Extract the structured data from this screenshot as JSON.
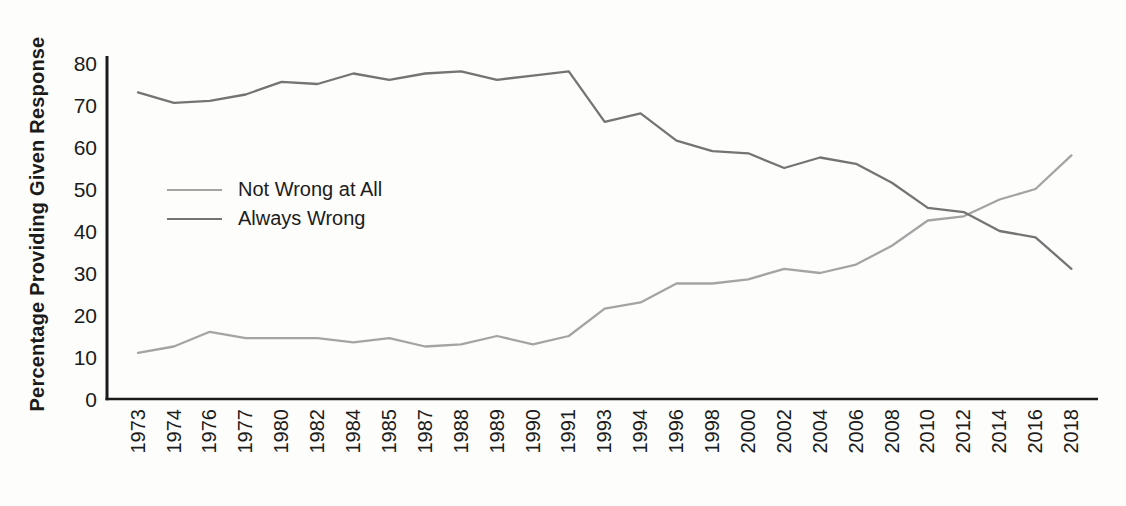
{
  "chart_data": {
    "type": "line",
    "title": "",
    "xlabel": "",
    "ylabel": "Percentage Providing Given Response",
    "categories": [
      "1973",
      "1974",
      "1976",
      "1977",
      "1980",
      "1982",
      "1984",
      "1985",
      "1987",
      "1988",
      "1989",
      "1990",
      "1991",
      "1993",
      "1994",
      "1996",
      "1998",
      "2000",
      "2002",
      "2004",
      "2006",
      "2008",
      "2010",
      "2012",
      "2014",
      "2016",
      "2018"
    ],
    "series": [
      {
        "name": "Not Wrong at All",
        "color": "#a4a4a4",
        "values": [
          11,
          12.5,
          16,
          14.5,
          14.5,
          14.5,
          13.5,
          14.5,
          12.5,
          13,
          15,
          13,
          15,
          21.5,
          23,
          27.5,
          27.5,
          28.5,
          31,
          30,
          32,
          36.5,
          42.5,
          43.5,
          47.5,
          50,
          58
        ]
      },
      {
        "name": "Always Wrong",
        "color": "#747474",
        "values": [
          73,
          70.5,
          71,
          72.5,
          75.5,
          75,
          77.5,
          76,
          77.5,
          78,
          76,
          77,
          78,
          66,
          68,
          61.5,
          59,
          58.5,
          55,
          57.5,
          56,
          51.5,
          45.5,
          44.5,
          40,
          38.5,
          31
        ]
      }
    ],
    "ylim": [
      0,
      80
    ],
    "yticks": [
      0,
      10,
      20,
      30,
      40,
      50,
      60,
      70,
      80
    ],
    "grid": false,
    "legend_position": "inside-left-middle",
    "x_tick_rotation_degrees": -90,
    "axis_color": "#1b1b1b",
    "text_color": "#1b1b1b"
  }
}
